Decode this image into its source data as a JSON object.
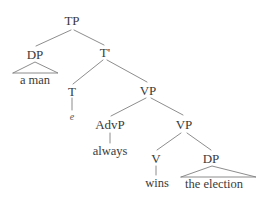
{
  "figure": {
    "kind": "syntax-tree",
    "sentence": "a man always wins the election",
    "background_color": "#ffffff",
    "line_color": "#808080",
    "text_color": "#3a3a3a"
  },
  "nodes": {
    "tp": "TP",
    "dp_subject": "DP",
    "tbar": "T'",
    "t": "T",
    "vp_upper": "VP",
    "advp": "AdvP",
    "vp_lower": "VP",
    "v": "V",
    "dp_object": "DP"
  },
  "terminals": {
    "a_man": "a man",
    "trace_e": "e",
    "always": "always",
    "wins": "wins",
    "the_election": "the election"
  },
  "edges": [
    {
      "name": "tp-to-dp",
      "from": "TP",
      "to": "DP",
      "style": "line"
    },
    {
      "name": "tp-to-tbar",
      "from": "TP",
      "to": "T'",
      "style": "line"
    },
    {
      "name": "dp-triangle",
      "from": "DP",
      "to": "a man",
      "style": "triangle"
    },
    {
      "name": "tbar-to-t",
      "from": "T'",
      "to": "T",
      "style": "line"
    },
    {
      "name": "tbar-to-vp",
      "from": "T'",
      "to": "VP",
      "style": "line"
    },
    {
      "name": "t-to-trace",
      "from": "T",
      "to": "e",
      "style": "line"
    },
    {
      "name": "vp-to-advp",
      "from": "VP",
      "to": "AdvP",
      "style": "line"
    },
    {
      "name": "vp-to-vp",
      "from": "VP",
      "to": "VP",
      "style": "line"
    },
    {
      "name": "advp-to-always",
      "from": "AdvP",
      "to": "always",
      "style": "line"
    },
    {
      "name": "vp-to-v",
      "from": "VP",
      "to": "V",
      "style": "line"
    },
    {
      "name": "vp-to-dp",
      "from": "VP",
      "to": "DP",
      "style": "line"
    },
    {
      "name": "v-to-wins",
      "from": "V",
      "to": "wins",
      "style": "line"
    },
    {
      "name": "dp-triangle-object",
      "from": "DP",
      "to": "the election",
      "style": "triangle"
    }
  ]
}
